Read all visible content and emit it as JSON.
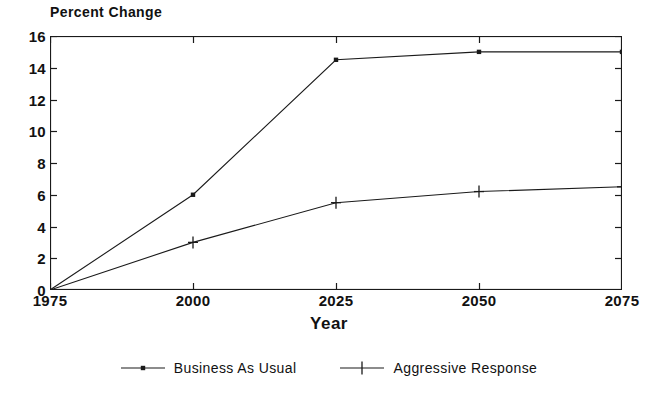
{
  "chart_data": {
    "type": "line",
    "title": "",
    "ylabel": "Percent Change",
    "xlabel": "Year",
    "x": [
      1975,
      2000,
      2025,
      2050,
      2075
    ],
    "xtick_labels": [
      "1975",
      "2000",
      "2025",
      "2050",
      "2075"
    ],
    "ytick_labels": [
      "0",
      "2",
      "4",
      "6",
      "8",
      "10",
      "12",
      "14",
      "16"
    ],
    "yticks": [
      0,
      2,
      4,
      6,
      8,
      10,
      12,
      14,
      16
    ],
    "xlim": [
      1975,
      2075
    ],
    "ylim": [
      0,
      16
    ],
    "grid": false,
    "legend_position": "bottom",
    "series": [
      {
        "name": "Business As Usual",
        "marker": "dot",
        "color": "#1a1a1a",
        "values": [
          0,
          6.0,
          14.5,
          15.0,
          15.0
        ]
      },
      {
        "name": "Aggressive Response",
        "marker": "plus",
        "color": "#1a1a1a",
        "values": [
          0,
          3.0,
          5.5,
          6.2,
          6.5
        ]
      }
    ]
  },
  "legend": {
    "entries": [
      {
        "label": "Business As Usual",
        "marker": "dot"
      },
      {
        "label": "Aggressive Response",
        "marker": "plus"
      }
    ]
  },
  "colors": {
    "line": "#1a1a1a",
    "axis": "#1a1a1a",
    "background": "#ffffff"
  }
}
